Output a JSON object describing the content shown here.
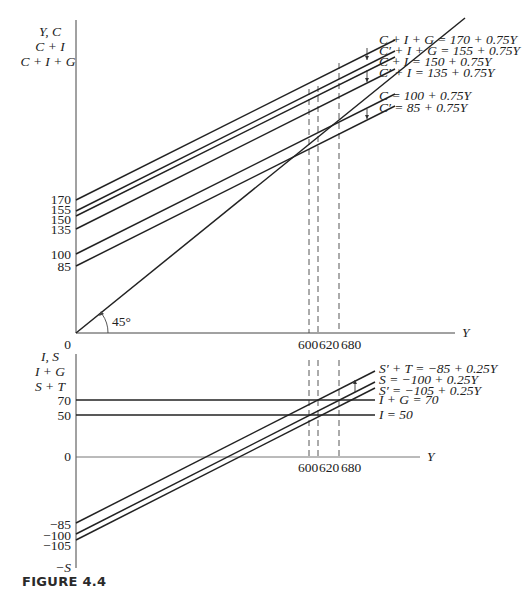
{
  "figure": {
    "caption": "FIGURE 4.4"
  },
  "top_panel": {
    "y_axis_labels": [
      "Y, C",
      "C + I",
      "C + I + G"
    ],
    "x_axis_label": "Y",
    "origin_label": "0",
    "angle_label": "45°",
    "y_ticks": [
      {
        "value": 170,
        "label": "170"
      },
      {
        "value": 155,
        "label": "155"
      },
      {
        "value": 150,
        "label": "150"
      },
      {
        "value": 135,
        "label": "135"
      },
      {
        "value": 100,
        "label": "100"
      },
      {
        "value": 85,
        "label": "85"
      }
    ],
    "x_ticks": [
      {
        "value": 600,
        "label": "600"
      },
      {
        "value": 620,
        "label": "620"
      },
      {
        "value": 680,
        "label": "680"
      }
    ],
    "lines": [
      {
        "name": "C+I+G",
        "label": "C + I + G = 170 + 0.75Y",
        "intercept": 170,
        "slope": 0.75
      },
      {
        "name": "C'+I+G",
        "label": "C′ + I + G = 155 + 0.75Y",
        "intercept": 155,
        "slope": 0.75
      },
      {
        "name": "C+I",
        "label": "C + I = 150 + 0.75Y",
        "intercept": 150,
        "slope": 0.75
      },
      {
        "name": "C'+I",
        "label": "C′ + I = 135 + 0.75Y",
        "intercept": 135,
        "slope": 0.75
      },
      {
        "name": "C",
        "label": "C = 100 + 0.75Y",
        "intercept": 100,
        "slope": 0.75
      },
      {
        "name": "C'",
        "label": "C′ = 85 + 0.75Y",
        "intercept": 85,
        "slope": 0.75
      },
      {
        "name": "45-degree",
        "label": "",
        "intercept": 0,
        "slope": 1
      }
    ]
  },
  "bottom_panel": {
    "y_axis_labels": [
      "I, S",
      "I + G",
      "S + T"
    ],
    "y_axis_negative_label": "−S",
    "x_axis_label": "Y",
    "origin_label": "0",
    "y_ticks": [
      {
        "value": 70,
        "label": "70"
      },
      {
        "value": 50,
        "label": "50"
      },
      {
        "value": -85,
        "label": "−85"
      },
      {
        "value": -100,
        "label": "−100"
      },
      {
        "value": -105,
        "label": "−105"
      }
    ],
    "x_ticks": [
      {
        "value": 600,
        "label": "600"
      },
      {
        "value": 620,
        "label": "620"
      },
      {
        "value": 680,
        "label": "680"
      }
    ],
    "lines": [
      {
        "name": "S'+T",
        "label": "S′ + T = −85 + 0.25Y",
        "intercept": -85,
        "slope": 0.25
      },
      {
        "name": "S",
        "label": "S = −100 + 0.25Y",
        "intercept": -100,
        "slope": 0.25
      },
      {
        "name": "S'",
        "label": "S′ = −105 + 0.25Y",
        "intercept": -105,
        "slope": 0.25
      },
      {
        "name": "I+G",
        "label": "I + G = 70",
        "intercept": 70,
        "slope": 0
      },
      {
        "name": "I",
        "label": "I = 50",
        "intercept": 50,
        "slope": 0
      }
    ]
  }
}
